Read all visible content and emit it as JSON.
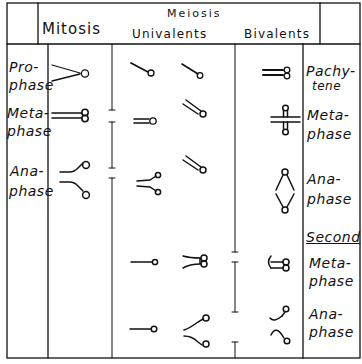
{
  "header": {
    "mitosis": "Mitosis",
    "meiosis": "Meiosis",
    "univalents": "Univalents",
    "bivalents": "Bivalents"
  },
  "left_labels": {
    "prophase": [
      "Pro-",
      "phase"
    ],
    "metaphase": [
      "Meta-",
      "phase"
    ],
    "anaphase": [
      "Ana-",
      "phase"
    ]
  },
  "right_labels": {
    "pachytene": [
      "Pachy-",
      "tene"
    ],
    "metaphase": [
      "Meta-",
      "phase"
    ],
    "anaphase": [
      "Ana-",
      "phase"
    ],
    "second": "Second",
    "second_metaphase": [
      "Meta-",
      "phase"
    ],
    "second_anaphase": [
      "Ana-",
      "phase"
    ]
  },
  "colors": {
    "ink": "#111111",
    "paper": "#ffffff"
  }
}
